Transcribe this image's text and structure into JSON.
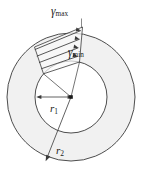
{
  "figure": {
    "kind": "torsion-shear-strain-annulus",
    "labels": {
      "gamma_symbol": "γ",
      "gamma_max_sub": "max",
      "gamma_min_sub": "min",
      "r1_symbol": "r",
      "r1_sub": "1",
      "r2_symbol": "r",
      "r2_sub": "2"
    },
    "colors": {
      "stroke": "#3a3a3a",
      "annulus_fill": "#f1f1f1",
      "inner_fill": "#ffffff",
      "wedge_fill": "#fafafa",
      "text": "#1a1a1a",
      "background": "#ffffff"
    },
    "geometry": {
      "center_x": 71,
      "center_y": 97,
      "inner_radius": 36,
      "outer_radius": 64,
      "arrow_count": 4
    }
  }
}
